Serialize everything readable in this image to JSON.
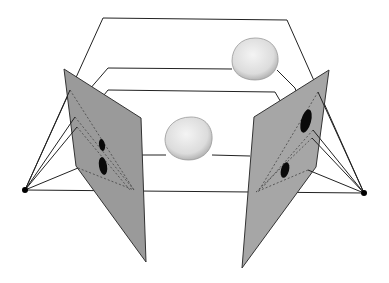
{
  "diagram": {
    "title": "Two-view stereo projection of 3D objects",
    "background": "#ffffff",
    "colors": {
      "plane_fill": "#9a9a9a",
      "plane_stroke": "#333333",
      "line": "#222222",
      "object_fill": "#e6e6e6",
      "projection_fill": "#0a0a0a",
      "camera": "#000000"
    },
    "cameras": [
      {
        "name": "left-camera-center",
        "x": 25,
        "y": 190
      },
      {
        "name": "right-camera-center",
        "x": 364,
        "y": 193
      }
    ],
    "image_planes": [
      {
        "name": "left-image-plane",
        "points": "64,69 141,118 146,262 76,166"
      },
      {
        "name": "right-image-plane",
        "points": "329,70 254,117 242,268 316,167"
      }
    ],
    "objects": [
      {
        "name": "upper-object",
        "cx": 255,
        "cy": 59,
        "rx": 23,
        "ry": 21
      },
      {
        "name": "lower-object",
        "cx": 189,
        "cy": 138,
        "rx": 24,
        "ry": 22
      }
    ],
    "projections": [
      {
        "name": "left-projection-upper",
        "cx": 102,
        "cy": 145,
        "rx": 3,
        "ry": 6
      },
      {
        "name": "left-projection-lower",
        "cx": 103,
        "cy": 166,
        "rx": 4,
        "ry": 9
      },
      {
        "name": "right-projection-upper",
        "cx": 306,
        "cy": 121,
        "rx": 5,
        "ry": 12
      },
      {
        "name": "right-projection-lower",
        "cx": 285,
        "cy": 170,
        "rx": 4,
        "ry": 8
      }
    ]
  }
}
